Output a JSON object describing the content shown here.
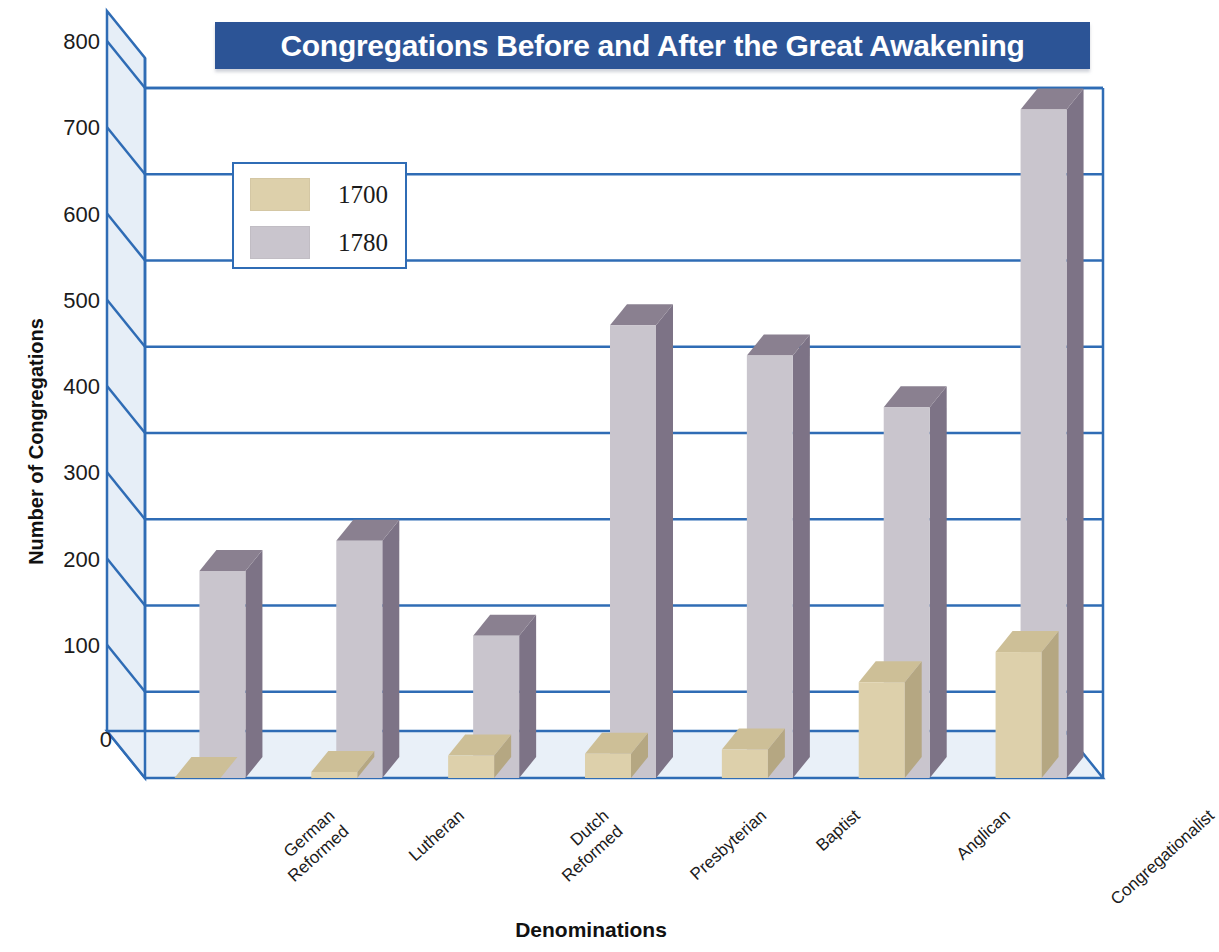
{
  "title": "Congregations Before and After the Great Awakening",
  "axis": {
    "y_title": "Number of Congregations",
    "x_title": "Denominations"
  },
  "legend": {
    "items": [
      {
        "label": "1700",
        "color": "#ddd0ab"
      },
      {
        "label": "1780",
        "color": "#c9c5cd"
      }
    ]
  },
  "colors": {
    "title_banner": "#2c5496",
    "grid_line": "#2f6cb5",
    "axis_line": "#2f6cb5",
    "wall_fill": "#e6eef7",
    "floor_fill": "#e9f0f8",
    "series_1700": "#ddd0ab",
    "series_1700_top": "#cdbf97",
    "series_1700_side": "#b5a782",
    "series_1780": "#c9c5cd",
    "series_1780_top": "#8a8090",
    "series_1780_side": "#7d7386",
    "text": "#1b1b1b"
  },
  "chart_data": {
    "type": "bar",
    "title": "Congregations Before and After the Great Awakening",
    "xlabel": "Denominations",
    "ylabel": "Number of Congregations",
    "ylim": [
      0,
      800
    ],
    "ytick_labels": [
      "0",
      "100",
      "200",
      "300",
      "400",
      "500",
      "600",
      "700",
      "800"
    ],
    "yticks": [
      0,
      100,
      200,
      300,
      400,
      500,
      600,
      700,
      800
    ],
    "grid": true,
    "legend_position": "upper-left-inside",
    "categories": [
      "German\nReformed",
      "Lutheran",
      "Dutch\nReformed",
      "Presbyterian",
      "Baptist",
      "Anglican",
      "Congregationalist"
    ],
    "series": [
      {
        "name": "1700",
        "values": [
          0,
          7,
          26,
          28,
          33,
          111,
          146
        ]
      },
      {
        "name": "1780",
        "values": [
          240,
          275,
          165,
          525,
          490,
          430,
          775
        ]
      }
    ]
  }
}
